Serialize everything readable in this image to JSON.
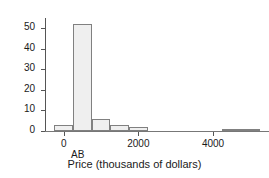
{
  "chart_data": {
    "type": "bar",
    "title": "",
    "xlabel": "Price (thousands of dollars)",
    "ylabel": "Frequency",
    "xlim": [
      -500,
      5500
    ],
    "ylim": [
      0,
      55
    ],
    "grid": false,
    "legend": null,
    "xticks": [
      0,
      2000,
      4000
    ],
    "xtick_labels": [
      "0",
      "2000",
      "4000"
    ],
    "yticks": [
      0,
      10,
      20,
      30,
      40,
      50
    ],
    "ytick_labels": [
      "0",
      "10",
      "20",
      "30",
      "40",
      "50"
    ],
    "bin_width": 500,
    "bins": [
      {
        "left": -250,
        "right": 250,
        "value": 3
      },
      {
        "left": 250,
        "right": 750,
        "value": 52
      },
      {
        "left": 750,
        "right": 1250,
        "value": 6
      },
      {
        "left": 1250,
        "right": 1750,
        "value": 3
      },
      {
        "left": 1750,
        "right": 2250,
        "value": 2
      },
      {
        "left": 4250,
        "right": 4750,
        "value": 1
      },
      {
        "left": 4750,
        "right": 5250,
        "value": 1
      }
    ],
    "categories": [
      "-250 to 250",
      "250 to 750",
      "750 to 1250",
      "1250 to 1750",
      "1750 to 2250",
      "4250 to 4750",
      "4750 to 5250"
    ],
    "values": [
      3,
      52,
      6,
      3,
      2,
      1,
      1
    ],
    "annotations": [
      {
        "text": "AB",
        "x": 375,
        "position": "below-axis"
      }
    ],
    "colors": {
      "bar_fill": "#efefef",
      "bar_edge": "#808080",
      "axis": "#555555",
      "text": "#1a1a1a",
      "background": "#ffffff"
    }
  }
}
